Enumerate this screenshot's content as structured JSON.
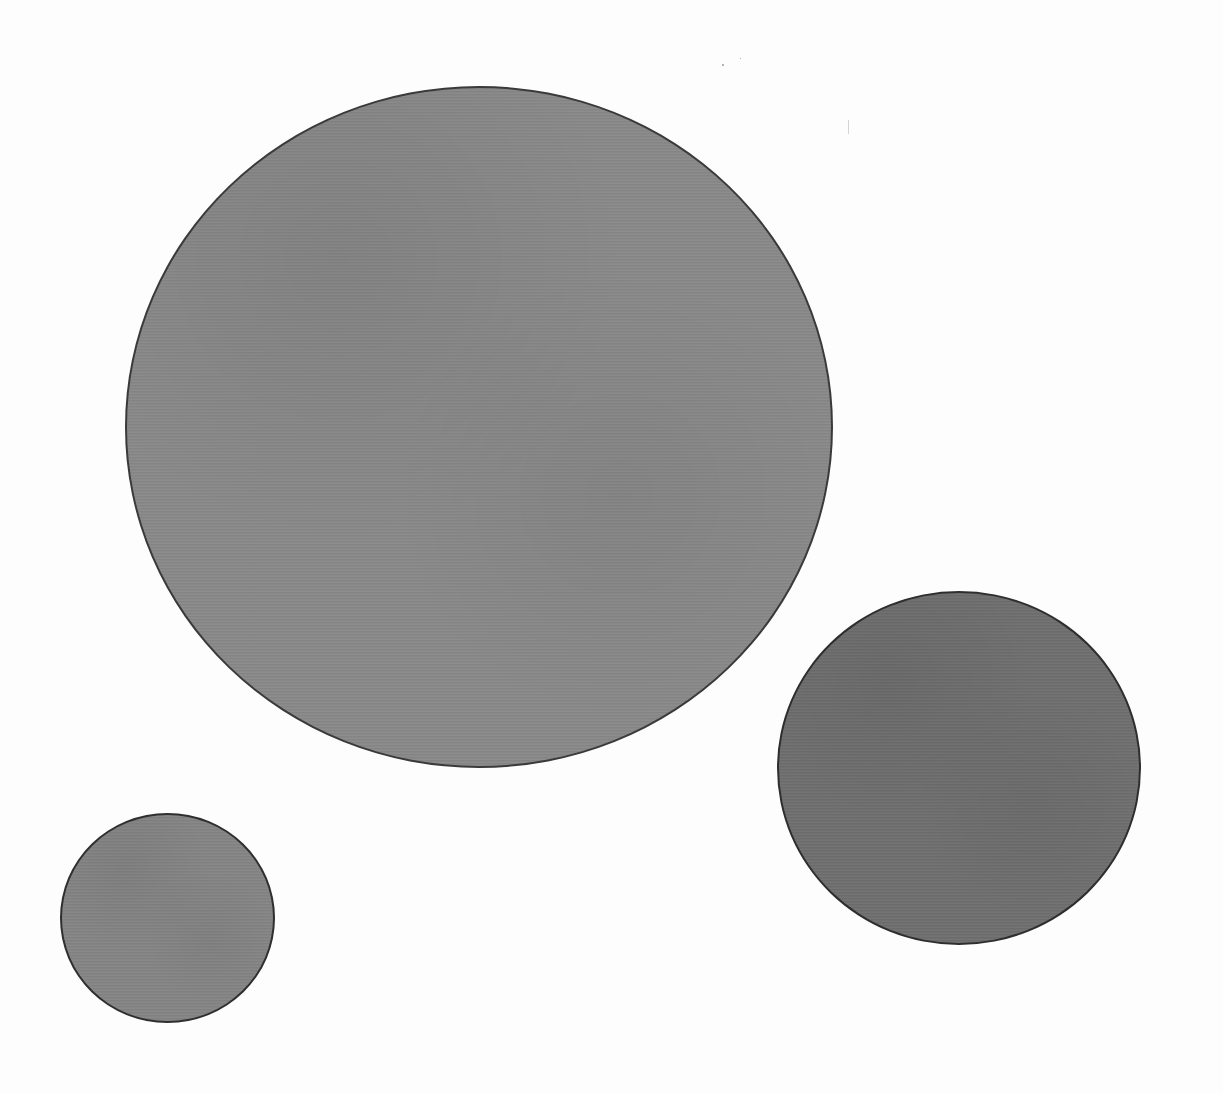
{
  "scene": {
    "description": "Three gray paper circles on a white background",
    "background_color": "#fdfdfd",
    "width": 1223,
    "height": 1093
  },
  "shapes": [
    {
      "id": "large-circle",
      "left": 125,
      "top": 86,
      "width": 708,
      "height": 682,
      "fill": "#898989",
      "border": "#3a3a3a"
    },
    {
      "id": "medium-circle",
      "left": 777,
      "top": 591,
      "width": 364,
      "height": 354,
      "fill": "#6f6f6f",
      "border": "#2e2e2e"
    },
    {
      "id": "small-circle",
      "left": 60,
      "top": 813,
      "width": 215,
      "height": 210,
      "fill": "#858585",
      "border": "#2f2f2f"
    }
  ]
}
